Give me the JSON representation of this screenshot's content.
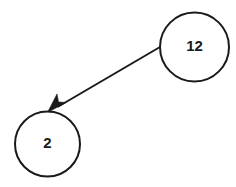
{
  "diagram": {
    "type": "directed-graph",
    "background_color": "#ffffff",
    "stroke_color": "#1a1a1a",
    "nodes": [
      {
        "id": "node-12",
        "label": "12",
        "shape": "circle",
        "cx": 194.5,
        "cy": 47,
        "r": 34.5,
        "fill": "#ffffff",
        "stroke": "#1a1a1a"
      },
      {
        "id": "node-2",
        "label": "2",
        "shape": "circle",
        "cx": 47.5,
        "cy": 144,
        "r": 32.5,
        "fill": "#ffffff",
        "stroke": "#1a1a1a"
      }
    ],
    "edges": [
      {
        "id": "edge-12-to-2",
        "from": "node-12",
        "to": "node-2",
        "directed": true,
        "arrowhead": "filled-barbed",
        "x1": 160,
        "y1": 47,
        "x2": 51,
        "y2": 111,
        "stroke": "#1a1a1a"
      }
    ]
  }
}
